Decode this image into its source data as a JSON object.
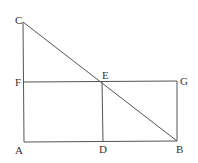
{
  "diagram": {
    "points": {
      "A": {
        "x": 24,
        "y": 142,
        "label": "A",
        "lx": 15,
        "ly": 154
      },
      "B": {
        "x": 177,
        "y": 141,
        "label": "B",
        "lx": 176,
        "ly": 153
      },
      "C": {
        "x": 23,
        "y": 22,
        "label": "C",
        "lx": 15,
        "ly": 24
      },
      "D": {
        "x": 103,
        "y": 141.5,
        "label": "D",
        "lx": 99,
        "ly": 153
      },
      "E": {
        "x": 102,
        "y": 82,
        "label": "E",
        "lx": 102,
        "ly": 79
      },
      "F": {
        "x": 24,
        "y": 82,
        "label": "F",
        "lx": 15,
        "ly": 86
      },
      "G": {
        "x": 177,
        "y": 81,
        "label": "G",
        "lx": 180,
        "ly": 85
      }
    },
    "segments": [
      [
        "C",
        "A"
      ],
      [
        "A",
        "B"
      ],
      [
        "C",
        "B"
      ],
      [
        "F",
        "G"
      ],
      [
        "E",
        "D"
      ],
      [
        "G",
        "B"
      ]
    ],
    "colors": {
      "line": "#555555",
      "label": "#333333",
      "background": "#ffffff"
    }
  }
}
